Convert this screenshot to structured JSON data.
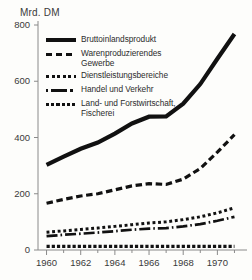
{
  "chart_data": {
    "type": "line",
    "title": "",
    "ylabel": "Mrd. DM",
    "xlabel": "",
    "ylim": [
      0,
      800
    ],
    "xlim": [
      1959.5,
      1971.5
    ],
    "grid": false,
    "legend_position": "upper-left-inside",
    "yticks": [
      "0",
      "200",
      "400",
      "600",
      "800"
    ],
    "ytick_values": [
      0,
      200,
      400,
      600,
      800
    ],
    "xticks": [
      "1960",
      "1962",
      "1964",
      "1966",
      "1968",
      "1970"
    ],
    "xtick_values": [
      1960,
      1962,
      1964,
      1966,
      1968,
      1970
    ],
    "x": [
      1960,
      1961,
      1962,
      1963,
      1964,
      1965,
      1966,
      1967,
      1968,
      1969,
      1970,
      1971
    ],
    "series": [
      {
        "name": "Bruttoinlandsprodukt",
        "style": "solid-thick",
        "values": [
          303,
          332,
          360,
          382,
          414,
          450,
          474,
          475,
          520,
          590,
          680,
          768
        ]
      },
      {
        "name": "Warenproduzierendes Gewerbe",
        "style": "dashed",
        "values": [
          166,
          180,
          192,
          200,
          214,
          228,
          236,
          233,
          252,
          290,
          348,
          410
        ]
      },
      {
        "name": "Dienstleistungsbereiche",
        "style": "dotted",
        "values": [
          63,
          68,
          73,
          78,
          84,
          90,
          96,
          100,
          108,
          118,
          132,
          150
        ]
      },
      {
        "name": "Handel und Verkehr",
        "style": "dash-dot",
        "values": [
          49,
          54,
          58,
          62,
          67,
          72,
          76,
          78,
          84,
          92,
          104,
          118
        ]
      },
      {
        "name": "Land- und Forstwirtschaft, Fischerei",
        "style": "square-dot",
        "values": [
          13,
          13,
          13,
          13,
          13,
          13,
          13,
          13,
          13,
          13,
          13,
          13
        ]
      }
    ],
    "colors": {
      "line": "#111111",
      "axis": "#8a8a8a",
      "text": "#2c2c2c",
      "background": "#fdfdfb"
    }
  },
  "legend": {
    "entries": [
      {
        "label": "Bruttoinlandsprodukt",
        "swatch": "solid-thick"
      },
      {
        "label": "Warenproduzierendes\nGewerbe",
        "swatch": "dashed"
      },
      {
        "label": "Dienstleistungsbereiche",
        "swatch": "dotted"
      },
      {
        "label": "Handel und Verkehr",
        "swatch": "dash-dot"
      },
      {
        "label": "Land- und Forstwirtschaft,\nFischerei",
        "swatch": "square-dot"
      }
    ]
  }
}
